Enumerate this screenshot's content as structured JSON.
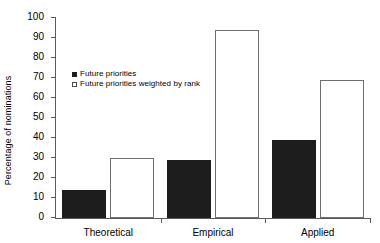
{
  "chart_data": {
    "type": "bar",
    "title": "",
    "xlabel": "",
    "ylabel": "Percentage of nominations",
    "categories": [
      "Theoretical",
      "Empirical",
      "Applied"
    ],
    "series": [
      {
        "name": "Future priorities",
        "values": [
          14,
          29,
          39
        ],
        "color": "#1d1d1d",
        "style": "filled"
      },
      {
        "name": "Future priorities weighted by rank",
        "values": [
          30,
          94,
          69
        ],
        "color": "#ffffff",
        "style": "open"
      }
    ],
    "ylim": [
      0,
      100
    ],
    "ytick_labels": [
      "0",
      "10",
      "20",
      "30",
      "40",
      "50",
      "60",
      "70",
      "80",
      "90",
      "100"
    ],
    "ytick_values": [
      0,
      10,
      20,
      30,
      40,
      50,
      60,
      70,
      80,
      90,
      100
    ],
    "grid": false,
    "legend_position": "inside-upper-left"
  }
}
